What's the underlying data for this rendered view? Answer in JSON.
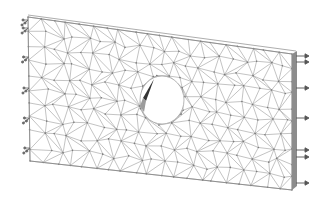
{
  "figure": {
    "background": "#ffffff",
    "mesh_color": "#9a9a9a",
    "node_color": "#7a7a7a",
    "edge_color": "#8a8a8a",
    "plate": {
      "corners": {
        "top_left": [
          28,
          17
        ],
        "top_right": [
          292,
          54
        ],
        "bottom_right": [
          292,
          190
        ],
        "bottom_left": [
          30,
          161
        ]
      },
      "thickness_edge_color": "#8c8c8c"
    },
    "hole": {
      "center": [
        162,
        100
      ],
      "rx": 22,
      "ry": 24,
      "shade_dark": "#333333",
      "shade_light": "#9c9c9c"
    },
    "supports": {
      "side": "left",
      "symbol": "fixed-constraint-triad",
      "y_positions": [
        20,
        28,
        57,
        88,
        118,
        148
      ]
    },
    "loads": {
      "side": "right",
      "symbol": "arrow-right",
      "y_positions": [
        56,
        62,
        88,
        118,
        150,
        157,
        183
      ]
    }
  }
}
